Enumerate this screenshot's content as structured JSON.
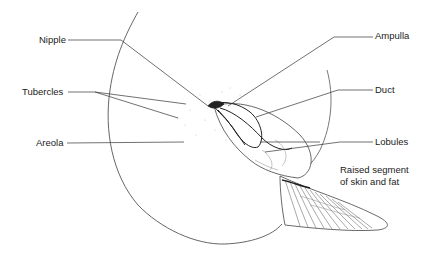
{
  "diagram": {
    "labels": {
      "nipple": "Nipple",
      "tubercles": "Tubercles",
      "areola": "Areola",
      "ampulla": "Ampulla",
      "duct": "Duct",
      "lobules": "Lobules",
      "raised_segment_line1": "Raised segment",
      "raised_segment_line2": "of skin and fat"
    },
    "colors": {
      "line": "#333333",
      "text": "#222222",
      "background": "#ffffff"
    }
  }
}
